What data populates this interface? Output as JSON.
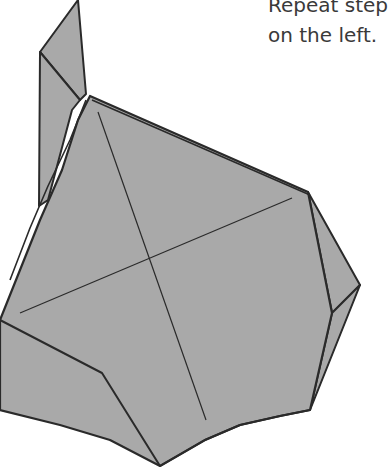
{
  "caption": {
    "line1": "Repeat step",
    "line2": "on the left."
  },
  "diagram": {
    "fill_color": "#a8a8a8",
    "stroke_color": "#2a2a2a"
  }
}
